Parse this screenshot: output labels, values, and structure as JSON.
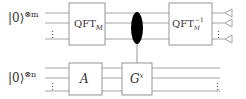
{
  "diagram": {
    "type": "quantum-circuit",
    "registers": [
      {
        "id": "top",
        "ket": "|0⟩",
        "power": "⊗m"
      },
      {
        "id": "bottom",
        "ket": "|0⟩",
        "power": "⊗n"
      }
    ],
    "gates": [
      {
        "id": "qft",
        "register": "top",
        "label": "QFT",
        "sub": "M",
        "sup": ""
      },
      {
        "id": "a",
        "register": "bottom",
        "label": "A",
        "sub": "",
        "sup": ""
      },
      {
        "id": "g",
        "register": "bottom",
        "label": "G",
        "sub": "",
        "sup": "x"
      },
      {
        "id": "iqft",
        "register": "top",
        "label": "QFT",
        "sub": "M",
        "sup": "−1"
      }
    ],
    "control": {
      "from": "top",
      "to": "g",
      "style": "filled-ellipse"
    },
    "measurements": {
      "register": "top",
      "count": 3
    },
    "ellipsis": "⋮"
  }
}
